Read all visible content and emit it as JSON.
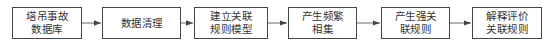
{
  "diagram": {
    "type": "flowchart",
    "direction": "left-to-right",
    "nodes": [
      {
        "id": "n1",
        "lines": [
          "塔吊事故",
          "数据库"
        ],
        "x": 12,
        "w": 70
      },
      {
        "id": "n2",
        "lines": [
          "数据清理"
        ],
        "x": 102,
        "w": 79
      },
      {
        "id": "n3",
        "lines": [
          "建立关联",
          "规则模型"
        ],
        "x": 194,
        "w": 74
      },
      {
        "id": "n4",
        "lines": [
          "产生频繁",
          "相集"
        ],
        "x": 288,
        "w": 69
      },
      {
        "id": "n5",
        "lines": [
          "产生强关",
          "联规则"
        ],
        "x": 381,
        "w": 69
      },
      {
        "id": "n6",
        "lines": [
          "解释评价",
          "关联规则"
        ],
        "x": 472,
        "w": 70
      }
    ],
    "edges": [
      {
        "from": "n1",
        "to": "n2"
      },
      {
        "from": "n2",
        "to": "n3"
      },
      {
        "from": "n3",
        "to": "n4"
      },
      {
        "from": "n4",
        "to": "n5"
      },
      {
        "from": "n5",
        "to": "n6"
      }
    ],
    "colors": {
      "stroke": "#444444",
      "text": "#333333",
      "background": "#ffffff"
    }
  }
}
